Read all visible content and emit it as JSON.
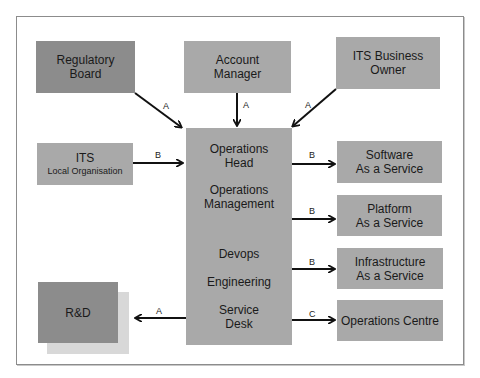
{
  "diagram": {
    "type": "organizational flow diagram",
    "nodes": {
      "regulatory_board": {
        "line1": "Regulatory",
        "line2": "Board"
      },
      "account_manager": {
        "line1": "Account",
        "line2": "Manager"
      },
      "its_business_owner": {
        "line1": "ITS Business",
        "line2": "Owner"
      },
      "its_local": {
        "line1": "ITS",
        "line2": "Local Organisation"
      },
      "center": {
        "items": [
          {
            "line1": "Operations",
            "line2": "Head"
          },
          {
            "line1": "Operations",
            "line2": "Management"
          },
          {
            "line1": "Devops",
            "line2": ""
          },
          {
            "line1": "Engineering",
            "line2": ""
          },
          {
            "line1": "Service",
            "line2": "Desk"
          }
        ]
      },
      "saas": {
        "line1": "Software",
        "line2": "As a Service"
      },
      "paas": {
        "line1": "Platform",
        "line2": "As a Service"
      },
      "iaas": {
        "line1": "Infrastructure",
        "line2": "As a Service"
      },
      "ops_centre": {
        "line1": "Operations Centre"
      },
      "rnd": {
        "line1": "R&D"
      }
    },
    "edges": [
      {
        "from": "Regulatory Board",
        "to": "Operations Head",
        "label": "A"
      },
      {
        "from": "Account Manager",
        "to": "Operations Head",
        "label": "A"
      },
      {
        "from": "ITS Business Owner",
        "to": "Operations Head",
        "label": "A"
      },
      {
        "from": "ITS Local Organisation",
        "to": "Operations Head",
        "label": "B"
      },
      {
        "from": "Operations Head",
        "to": "Software As a Service",
        "label": "B"
      },
      {
        "from": "Operations Management",
        "to": "Platform As a Service",
        "label": "B"
      },
      {
        "from": "Devops/Engineering",
        "to": "Infrastructure As a Service",
        "label": "B"
      },
      {
        "from": "Service Desk",
        "to": "Operations Centre",
        "label": "C"
      },
      {
        "from": "Service Desk",
        "to": "R&D",
        "label": "A"
      }
    ],
    "labels": {
      "reg": "A",
      "acct": "A",
      "owner": "A",
      "local": "B",
      "saas": "B",
      "paas": "B",
      "iaas": "B",
      "ops": "C",
      "rnd": "A"
    },
    "colors": {
      "box": "#a9a9a9",
      "box_dark": "#8c8c8c",
      "shadow": "#d8d8d8",
      "arrow": "#111111",
      "frame": "#8c8c8c"
    }
  }
}
